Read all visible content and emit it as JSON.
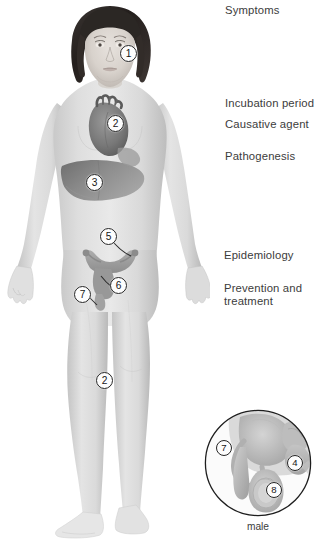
{
  "page": {
    "background_color": "#ffffff",
    "text_color": "#3c3c3c",
    "width": 318,
    "height": 548
  },
  "topics": [
    {
      "id": "symptoms",
      "label": "Symptoms"
    },
    {
      "id": "incubation",
      "label": "Incubation period"
    },
    {
      "id": "causative",
      "label": "Causative agent"
    },
    {
      "id": "pathogenesis",
      "label": "Pathogenesis"
    },
    {
      "id": "epidemiology",
      "label": "Epidemiology"
    },
    {
      "id": "prevention",
      "label": "Prevention and\ntreatment"
    }
  ],
  "figure": {
    "name": "female-body-anatomical-figure",
    "skin_color": "#d8d8d8",
    "hair_color": "#2e2a28",
    "organ_color": "#8e8e8e",
    "markers": [
      {
        "number": "1",
        "target": "head-neck",
        "x": 120,
        "y": 45
      },
      {
        "number": "2",
        "target": "heart",
        "x": 107,
        "y": 115
      },
      {
        "number": "3",
        "target": "liver",
        "x": 86,
        "y": 174
      },
      {
        "number": "5",
        "target": "uterus",
        "x": 100,
        "y": 228
      },
      {
        "number": "6",
        "target": "cervix",
        "x": 110,
        "y": 277
      },
      {
        "number": "7",
        "target": "vulva",
        "x": 74,
        "y": 286
      },
      {
        "number": "2",
        "target": "knee-joint",
        "x": 96,
        "y": 372
      }
    ]
  },
  "inset": {
    "name": "male-reproductive-inset",
    "caption": "male",
    "circle": {
      "cx": 258,
      "cy": 463,
      "r": 53
    },
    "markers": [
      {
        "number": "7",
        "target": "penis",
        "x": 216,
        "y": 440
      },
      {
        "number": "4",
        "target": "testis",
        "x": 287,
        "y": 455
      },
      {
        "number": "8",
        "target": "epididymis",
        "x": 266,
        "y": 482
      }
    ]
  }
}
